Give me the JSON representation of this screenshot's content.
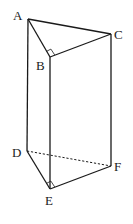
{
  "diagram": {
    "type": "triangular-prism",
    "vertices": {
      "A": {
        "label": "A",
        "x": 28,
        "y": 19
      },
      "B": {
        "label": "B",
        "x": 50,
        "y": 57
      },
      "C": {
        "label": "C",
        "x": 111,
        "y": 34
      },
      "D": {
        "label": "D",
        "x": 27,
        "y": 151
      },
      "E": {
        "label": "E",
        "x": 50,
        "y": 189
      },
      "F": {
        "label": "F",
        "x": 111,
        "y": 166
      }
    },
    "edges_visible": [
      "AB",
      "BC",
      "AC",
      "AD",
      "BE",
      "CF",
      "DE",
      "EF"
    ],
    "edges_hidden": [
      "DF"
    ],
    "right_angles": [
      "ABC",
      "DEF"
    ],
    "colors": {
      "stroke": "#1a1a1a",
      "background": "#ffffff"
    }
  }
}
